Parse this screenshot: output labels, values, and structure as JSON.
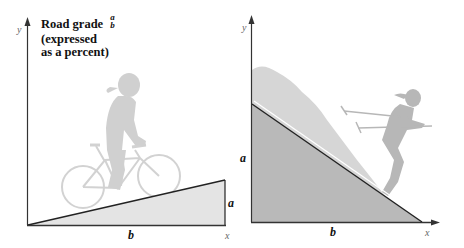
{
  "left_panel": {
    "title": {
      "line1": "Road grade",
      "fraction_numerator": "a",
      "fraction_denominator": "b",
      "line2": "(expressed",
      "line3": "as a percent)"
    },
    "axis_y_label": "y",
    "axis_x_label": "x",
    "side_vertical_label": "a",
    "side_horizontal_label": "b",
    "illustration": "cyclist-riding-uphill",
    "colors": {
      "triangle_fill": "#e4e4e4",
      "figure": "#cfcfcf",
      "axis": "#333333"
    }
  },
  "right_panel": {
    "axis_y_label": "y",
    "axis_x_label": "x",
    "side_vertical_label": "a",
    "side_horizontal_label": "b",
    "illustration": "skier-descending-slope",
    "colors": {
      "triangle_fill": "#b9b9b9",
      "snow": "#d4d4d4",
      "figure": "#b5b5b5",
      "axis": "#333333"
    }
  }
}
